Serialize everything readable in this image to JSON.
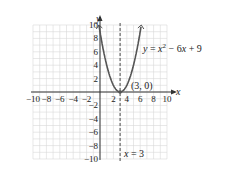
{
  "chart_data": {
    "type": "line",
    "title": "",
    "xlabel": "x",
    "ylabel": "y",
    "xlim": [
      -10,
      10
    ],
    "ylim": [
      -10,
      10
    ],
    "grid": true,
    "x_ticks": [
      -10,
      -8,
      -6,
      -4,
      -2,
      2,
      4,
      6,
      8,
      10
    ],
    "y_ticks": [
      10,
      8,
      6,
      4,
      2,
      -2,
      -4,
      -6,
      -8,
      -10
    ],
    "x_tick_labels": [
      "−10",
      "−8",
      "−6",
      "−4",
      "−2",
      "2",
      "4",
      "6",
      "8",
      "10"
    ],
    "y_tick_labels": [
      "10",
      "8",
      "6",
      "4",
      "2",
      "−2",
      "−4",
      "−6",
      "−8",
      "−10"
    ],
    "series": [
      {
        "name": "y = x^2 - 6x + 9",
        "style": "solid",
        "x": [
          -0.16,
          0,
          0.5,
          1,
          1.5,
          2,
          2.5,
          3,
          3.5,
          4,
          4.5,
          5,
          5.5,
          6,
          6.16
        ],
        "y": [
          10,
          9,
          6.25,
          4,
          2.25,
          1,
          0.25,
          0,
          0.25,
          1,
          2.25,
          4,
          6.25,
          9,
          10
        ]
      },
      {
        "name": "x = 3",
        "style": "dashed",
        "x": [
          3,
          3
        ],
        "y": [
          -10,
          10
        ]
      }
    ],
    "annotations": [
      {
        "text": "(3, 0)",
        "x": 3,
        "y": 0
      },
      {
        "text": "y = x² − 6x + 9",
        "label_for": "parabola"
      },
      {
        "text": "x = 3",
        "label_for": "axis-of-symmetry"
      }
    ]
  },
  "labels": {
    "x_axis": "x",
    "y_axis": "y",
    "equation_y": "y",
    "equation_eq": " = ",
    "equation_x": "x",
    "equation_sup": "2",
    "equation_rest": " − 6",
    "equation_x2": "x",
    "equation_end": " + 9",
    "vertex": "(3, 0)",
    "sym_x": "x",
    "sym_rest": " = 3"
  },
  "colors": {
    "grid": "#d9d9d9",
    "axis": "#333333",
    "curve": "#555555",
    "dashed": "#666666",
    "text": "#222222"
  }
}
